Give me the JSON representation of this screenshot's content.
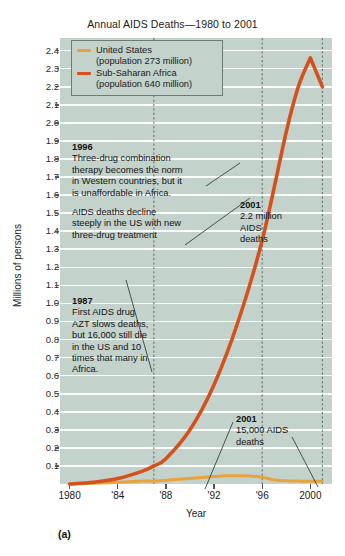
{
  "figure": {
    "panel_letter": "(a)",
    "title": "Annual AIDS Deaths—1980 to 2001",
    "ylabel": "Millions of persons",
    "xlabel": "Year"
  },
  "legend": {
    "items": [
      {
        "name": "United States",
        "sub": "(population 273 million)",
        "color": "#e8a33d"
      },
      {
        "name": "Sub-Saharan Africa",
        "sub": "(population 640 million)",
        "color": "#d4511e"
      }
    ]
  },
  "annotations": {
    "a1996": {
      "year": "1996",
      "lines": [
        "Three-drug combination",
        "therapy becomes the norm",
        "in Western countries, but it",
        "is unaffordable in Africa."
      ]
    },
    "decline": {
      "lines": [
        "AIDS deaths decline",
        "steeply in the US with new",
        "three-drug treatment"
      ]
    },
    "a1987": {
      "year": "1987",
      "lines": [
        "First AIDS drug",
        "AZT slows deaths,",
        "but 16,000 still die",
        "in the US and 10",
        "times that many in",
        "Africa."
      ]
    },
    "africa2001": {
      "year": "2001",
      "lines": [
        "2.2 million",
        "AIDS",
        "deaths"
      ]
    },
    "us2001": {
      "year": "2001",
      "lines": [
        "15,000 AIDS",
        "deaths"
      ]
    }
  },
  "chart_data": {
    "type": "line",
    "title": "Annual AIDS Deaths—1980 to 2001",
    "xlabel": "Year",
    "ylabel": "Millions of persons",
    "xlim": [
      1979.2,
      2001.8
    ],
    "ylim": [
      0.0,
      2.47
    ],
    "grid": true,
    "legend_position": "top-left",
    "xticks": [
      1980,
      1984,
      1988,
      1992,
      1996,
      2000
    ],
    "xtick_labels": [
      "1980",
      "'84",
      "'88",
      "'92",
      "'96",
      "2000"
    ],
    "yticks": [
      0.1,
      0.2,
      0.3,
      0.4,
      0.5,
      0.6,
      0.7,
      0.8,
      0.9,
      1.0,
      1.1,
      1.2,
      1.3,
      1.4,
      1.5,
      1.6,
      1.7,
      1.8,
      1.9,
      2.0,
      2.1,
      2.2,
      2.3,
      2.4
    ],
    "ytick_labels": [
      "0.1",
      "0.2",
      "0.3",
      "0.4",
      "0.5",
      "0.6",
      "0.7",
      "0.8",
      "0.9",
      "1.0",
      "1.1",
      "1.2",
      "1.3",
      "1.4",
      "1.5",
      "1.6",
      "1.7",
      "1.8",
      "1.9",
      "2.0",
      "2.1",
      "2.2",
      "2.3",
      "2.4"
    ],
    "marker_years": [
      1987,
      1996,
      2001
    ],
    "series": [
      {
        "name": "United States",
        "color": "#e8a33d",
        "x": [
          1980,
          1982,
          1984,
          1986,
          1987,
          1988,
          1990,
          1992,
          1993,
          1994,
          1995,
          1996,
          1997,
          1998,
          1999,
          2000,
          2001
        ],
        "values": [
          0.0,
          0.004,
          0.009,
          0.016,
          0.016,
          0.021,
          0.031,
          0.041,
          0.045,
          0.046,
          0.044,
          0.038,
          0.022,
          0.018,
          0.016,
          0.015,
          0.015
        ]
      },
      {
        "name": "Sub-Saharan Africa",
        "color": "#d4511e",
        "x": [
          1980,
          1982,
          1984,
          1986,
          1987,
          1988,
          1990,
          1992,
          1994,
          1996,
          1998,
          1999,
          2000,
          2001
        ],
        "values": [
          0.0,
          0.01,
          0.03,
          0.07,
          0.1,
          0.14,
          0.3,
          0.55,
          0.9,
          1.35,
          1.95,
          2.2,
          2.36,
          2.2
        ]
      }
    ]
  }
}
